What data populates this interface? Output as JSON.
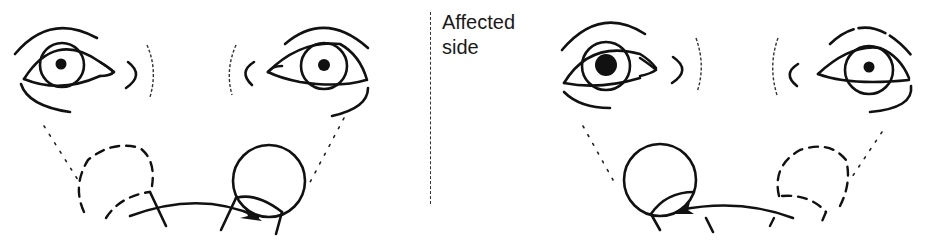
{
  "caption": {
    "line1": "Affected",
    "line2": "side"
  },
  "panels": [
    {
      "id": "left-panel",
      "description": "Head/eyes looking toward right with arrow moving right",
      "left_pupil": "small",
      "right_pupil": "small",
      "arrow_direction": "right"
    },
    {
      "id": "right-panel",
      "description": "Head/eyes with arrow moving left; left pupil enlarged",
      "left_pupil": "large",
      "right_pupil": "small",
      "arrow_direction": "left"
    }
  ],
  "colors": {
    "ink": "#111111",
    "background": "#ffffff"
  }
}
